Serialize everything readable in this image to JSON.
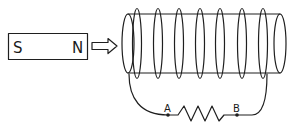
{
  "figure": {
    "magnet": {
      "south_label": "S",
      "north_label": "N",
      "motion": "arrow pointing toward coil"
    },
    "coil": {
      "turns": 7
    },
    "circuit": {
      "point_a_label": "A",
      "point_b_label": "B",
      "component": "resistor"
    },
    "colors": {
      "line": "#1f1f1f",
      "background": "#ffffff"
    }
  }
}
